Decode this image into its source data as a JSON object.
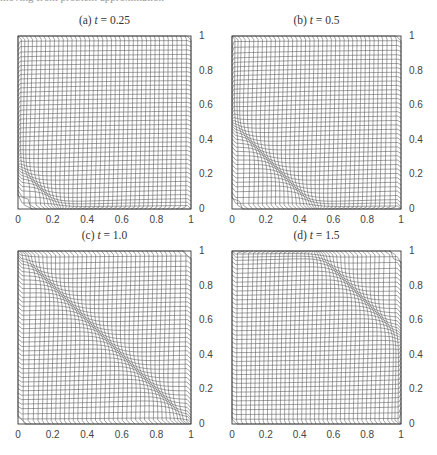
{
  "header": {
    "partial_text": "moving front problem approximation"
  },
  "chart_data": [
    {
      "type": "mesh",
      "title": "(a) t = 0.25",
      "label": "(a)",
      "param": "t",
      "value": "0.25",
      "front_position": 0.25,
      "xlim": [
        0,
        1
      ],
      "ylim": [
        0,
        1
      ],
      "xticks": [
        "0",
        "0.2",
        "0.4",
        "0.6",
        "0.8",
        "1"
      ],
      "yticks": [
        "0",
        "0.2",
        "0.4",
        "0.6",
        "0.8",
        "1"
      ],
      "yaxis_side": "right",
      "grid_lines": 41,
      "description": "Adaptive mesh concentrated along line x + y = 0.25 near lower-left corner"
    },
    {
      "type": "mesh",
      "title": "(b) t = 0.5",
      "label": "(b)",
      "param": "t",
      "value": "0.5",
      "front_position": 0.5,
      "xlim": [
        0,
        1
      ],
      "ylim": [
        0,
        1
      ],
      "xticks": [
        "0",
        "0.2",
        "0.4",
        "0.6",
        "0.8",
        "1"
      ],
      "yticks": [
        "0",
        "0.2",
        "0.4",
        "0.6",
        "0.8",
        "1"
      ],
      "yaxis_side": "right",
      "grid_lines": 41,
      "description": "Adaptive mesh concentrated along line x + y = 0.5"
    },
    {
      "type": "mesh",
      "title": "(c) t = 1.0",
      "label": "(c)",
      "param": "t",
      "value": "1.0",
      "front_position": 1.0,
      "xlim": [
        0,
        1
      ],
      "ylim": [
        0,
        1
      ],
      "xticks": [
        "0",
        "0.2",
        "0.4",
        "0.6",
        "0.8",
        "1"
      ],
      "yticks": [
        "0",
        "0.2",
        "0.4",
        "0.6",
        "0.8",
        "1"
      ],
      "yaxis_side": "right",
      "grid_lines": 41,
      "description": "Adaptive mesh concentrated along diagonal x + y = 1"
    },
    {
      "type": "mesh",
      "title": "(d) t = 1.5",
      "label": "(d)",
      "param": "t",
      "value": "1.5",
      "front_position": 1.5,
      "xlim": [
        0,
        1
      ],
      "ylim": [
        0,
        1
      ],
      "xticks": [
        "0",
        "0.2",
        "0.4",
        "0.6",
        "0.8",
        "1"
      ],
      "yticks": [
        "0",
        "0.2",
        "0.4",
        "0.6",
        "0.8",
        "1"
      ],
      "yaxis_side": "right",
      "grid_lines": 41,
      "description": "Adaptive mesh concentrated along line x + y = 1.5 near upper-right"
    }
  ],
  "style": {
    "line_color": "#555555",
    "frame_color": "#333333"
  }
}
